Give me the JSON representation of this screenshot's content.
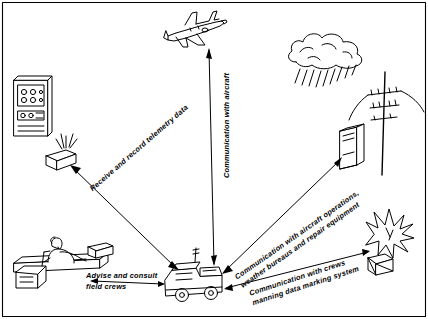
{
  "diagram": {
    "background_color": "#ffffff",
    "ink_color": "#000000",
    "labels": [
      {
        "id": "communication-with-aircraft",
        "text": "Communication with aircraft",
        "lines": [
          "Communication with aircraft"
        ],
        "x": 222,
        "y": 178,
        "rotation": -90
      },
      {
        "id": "receive-and-record-telemetry-data",
        "text": "Receive and record telemetry data",
        "lines": [
          "Receive and record telemetry data"
        ],
        "x": 88,
        "y": 186,
        "rotation": -41
      },
      {
        "id": "communication-with-aircraft-operations",
        "text": "Communication with aircraft operations, weather bureaus and repair equipment",
        "lines": [
          "Communication with aircraft operations,",
          "weather bureaus and repair equipment"
        ],
        "x": 233,
        "y": 274,
        "rotation": -35
      },
      {
        "id": "communication-with-crews",
        "text": "Communication with crews manning data marking system",
        "lines": [
          "Communication with crews",
          "manning data marking system"
        ],
        "x": 248,
        "y": 289,
        "rotation": -18
      },
      {
        "id": "advise-and-consult-field-crews",
        "text": "Advise and consult field crews",
        "lines": [
          "Advise and consult",
          "field crews"
        ],
        "x": 86,
        "y": 270,
        "rotation": 0
      }
    ],
    "nodes": [
      {
        "id": "aircraft",
        "name": "airplane",
        "x": 190,
        "y": 30
      },
      {
        "id": "storm-cloud",
        "name": "rain-cloud",
        "x": 330,
        "y": 55
      },
      {
        "id": "power-pole",
        "name": "utility-pole",
        "x": 385,
        "y": 110
      },
      {
        "id": "ground-station",
        "name": "equipment-cabinet",
        "x": 350,
        "y": 150
      },
      {
        "id": "telemetry-rack",
        "name": "instrument-rack",
        "x": 30,
        "y": 100
      },
      {
        "id": "antenna-box",
        "name": "antenna-unit",
        "x": 62,
        "y": 150
      },
      {
        "id": "operator",
        "name": "seated-operator-at-console",
        "x": 55,
        "y": 255
      },
      {
        "id": "truck",
        "name": "mobile-communications-truck",
        "x": 190,
        "y": 285
      },
      {
        "id": "explosion",
        "name": "blast-and-crate",
        "x": 385,
        "y": 235
      }
    ]
  }
}
